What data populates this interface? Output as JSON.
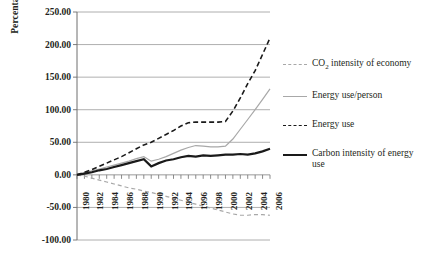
{
  "chart_data": {
    "type": "line",
    "title": "",
    "xlabel": "",
    "ylabel": "Percentage growth",
    "ylim": [
      -100,
      250
    ],
    "ytick_values": [
      250,
      200,
      150,
      100,
      50,
      0,
      -50,
      -100
    ],
    "ytick_labels": [
      "250.00",
      "200.00",
      "150.00",
      "100.00",
      "50.00",
      "0.00",
      "-50.00",
      "-100.00"
    ],
    "grid": true,
    "legend_position": "right",
    "xlim": [
      1980,
      2006
    ],
    "x": [
      1980,
      1981,
      1982,
      1983,
      1984,
      1985,
      1986,
      1987,
      1988,
      1989,
      1990,
      1991,
      1992,
      1993,
      1994,
      1995,
      1996,
      1997,
      1998,
      1999,
      2000,
      2001,
      2002,
      2003,
      2004,
      2005,
      2006
    ],
    "xtick_labels": [
      "1980",
      "1982",
      "1984",
      "1986",
      "1988",
      "1990",
      "1992",
      "1994",
      "1996",
      "1998",
      "2000",
      "2002",
      "2004",
      "2006"
    ],
    "series": [
      {
        "name": "CO2 intensity of economy",
        "label_html": "CO<sub>2</sub> intensity of economy",
        "style": "dashed",
        "color": "#a8a8a8",
        "width": 1.2,
        "values": [
          0,
          -2,
          -5,
          -8,
          -11,
          -14,
          -17,
          -20,
          -22,
          -25,
          -27,
          -30,
          -33,
          -36,
          -39,
          -42,
          -45,
          -48,
          -51,
          -54,
          -57,
          -60,
          -62,
          -62,
          -61,
          -61,
          -62
        ]
      },
      {
        "name": "Energy use/person",
        "label_html": "Energy use/person",
        "style": "solid",
        "color": "#a8a8a8",
        "width": 1.2,
        "values": [
          0,
          3,
          6,
          9,
          12,
          15,
          18,
          21,
          25,
          28,
          21,
          24,
          28,
          33,
          38,
          42,
          45,
          44,
          43,
          43,
          44,
          55,
          70,
          85,
          100,
          116,
          132
        ]
      },
      {
        "name": "Energy use",
        "label_html": "Energy use",
        "style": "dashed",
        "color": "#1a1a1a",
        "width": 1.6,
        "values": [
          0,
          4,
          8,
          13,
          18,
          23,
          28,
          34,
          40,
          46,
          50,
          56,
          62,
          68,
          75,
          80,
          81,
          81,
          81,
          81,
          82,
          98,
          118,
          140,
          160,
          185,
          210
        ]
      },
      {
        "name": "Carbon intensity of energy use",
        "label_html": "Carbon intensity of energy use",
        "style": "solid",
        "color": "#1a1a1a",
        "width": 2.2,
        "values": [
          0,
          2,
          4,
          7,
          9,
          12,
          15,
          18,
          21,
          24,
          13,
          18,
          22,
          24,
          27,
          29,
          28,
          30,
          29,
          30,
          31,
          31,
          32,
          31,
          33,
          36,
          40
        ]
      }
    ]
  }
}
